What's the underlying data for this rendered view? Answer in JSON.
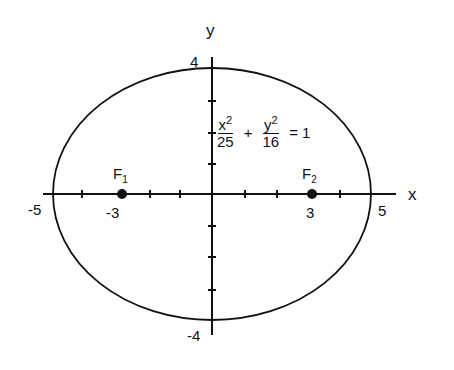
{
  "diagram": {
    "title": "",
    "equation": {
      "x_num": "x",
      "x_exp": "2",
      "x_den": "25",
      "plus": "+",
      "y_num": "y",
      "y_exp": "2",
      "y_den": "16",
      "equals": "= 1"
    },
    "axes": {
      "x_label": "x",
      "y_label": "y",
      "x_ticks": [
        "-5",
        "-3",
        "3",
        "5"
      ],
      "y_ticks": [
        "4",
        "-4"
      ]
    },
    "foci": [
      {
        "label": "F",
        "sub": "1",
        "x": -3,
        "y": 0
      },
      {
        "label": "F",
        "sub": "2",
        "x": 3,
        "y": 0
      }
    ],
    "ellipse": {
      "a": 5,
      "b": 4,
      "center": [
        0,
        0
      ]
    },
    "colors": {
      "stroke": "#111111",
      "background": "#ffffff"
    }
  }
}
